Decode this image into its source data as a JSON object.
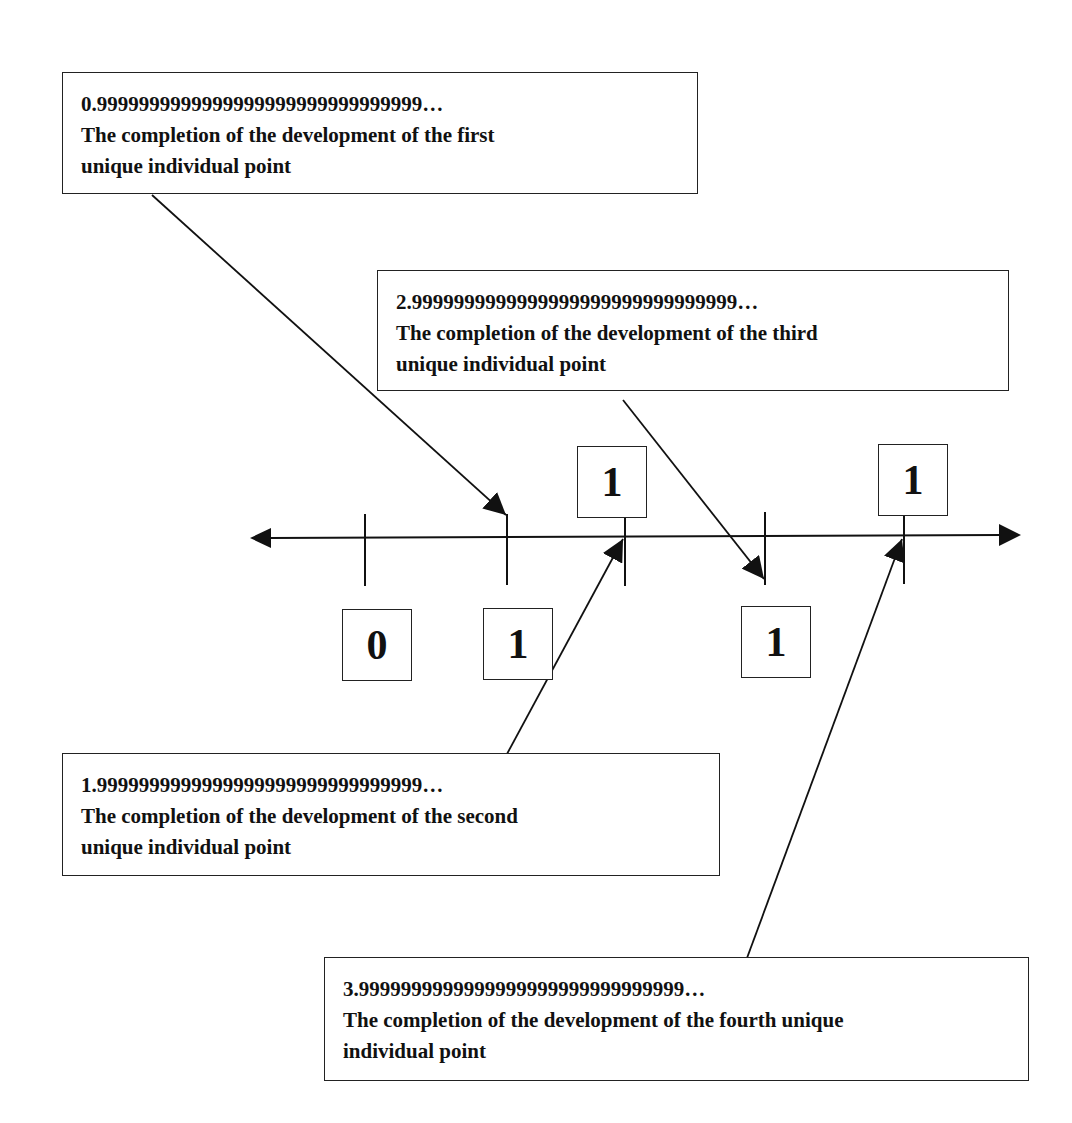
{
  "diagram": {
    "type": "number-line",
    "axis": {
      "direction": "bidirectional",
      "tick_count": 5
    },
    "tick_labels": [
      {
        "id": "t0",
        "value": "0",
        "position": "below"
      },
      {
        "id": "t1",
        "value": "1",
        "position": "below"
      },
      {
        "id": "t2",
        "value": "1",
        "position": "above"
      },
      {
        "id": "t3",
        "value": "1",
        "position": "below"
      },
      {
        "id": "t4",
        "value": "1",
        "position": "above"
      }
    ],
    "callouts": [
      {
        "id": "first",
        "number": "0.9999999999999999999999999999999…",
        "line1": "The completion of the development of the first",
        "line2": "unique individual point",
        "points_to_tick": 1
      },
      {
        "id": "third",
        "number": "2.9999999999999999999999999999999…",
        "line1": "The completion of the development of the third",
        "line2": "unique individual point",
        "points_to_tick": 3
      },
      {
        "id": "second",
        "number": "1.9999999999999999999999999999999…",
        "line1": "The completion of the development of the second",
        "line2": "unique individual point",
        "points_to_tick": 2
      },
      {
        "id": "fourth",
        "number": "3.9999999999999999999999999999999…",
        "line1": "The completion of the development of the fourth unique",
        "line2": "individual point",
        "points_to_tick": 4
      }
    ],
    "colors": {
      "line": "#111111",
      "background": "#ffffff",
      "text": "#111111"
    }
  }
}
